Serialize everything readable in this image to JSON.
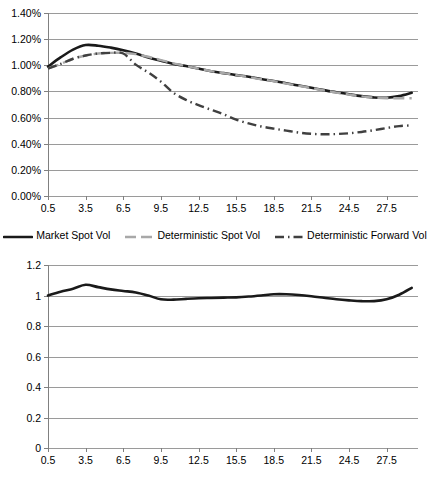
{
  "chart_data": [
    {
      "id": "volatility-term-structure",
      "type": "line",
      "title": "",
      "xlabel": "",
      "ylabel": "",
      "xlim": [
        0.5,
        30.0
      ],
      "ylim": [
        0.0,
        1.4
      ],
      "y_tick_labels": [
        "0.00%",
        "0.20%",
        "0.40%",
        "0.60%",
        "0.80%",
        "1.00%",
        "1.20%",
        "1.40%"
      ],
      "y_tick_values": [
        0.0,
        0.2,
        0.4,
        0.6,
        0.8,
        1.0,
        1.2,
        1.4
      ],
      "x_tick_labels": [
        "0.5",
        "3.5",
        "6.5",
        "9.5",
        "12.5",
        "15.5",
        "18.5",
        "21.5",
        "24.5",
        "27.5"
      ],
      "x_tick_values": [
        0.5,
        3.5,
        6.5,
        9.5,
        12.5,
        15.5,
        18.5,
        21.5,
        24.5,
        27.5
      ],
      "grid": "horizontal",
      "legend_position": "bottom",
      "x": [
        0.5,
        1.5,
        2.5,
        3.5,
        4.5,
        5.5,
        6.5,
        7.5,
        8.5,
        9.5,
        10.5,
        11.5,
        12.5,
        13.5,
        14.5,
        15.5,
        16.5,
        17.5,
        18.5,
        19.5,
        20.5,
        21.5,
        22.5,
        23.5,
        24.5,
        25.5,
        26.5,
        27.5,
        28.5,
        29.5
      ],
      "series": [
        {
          "name": "Market Spot Vol",
          "color": "#1a1a1a",
          "style": "solid",
          "values": [
            0.99,
            1.06,
            1.12,
            1.155,
            1.15,
            1.135,
            1.115,
            1.09,
            1.06,
            1.035,
            1.01,
            0.995,
            0.975,
            0.955,
            0.94,
            0.925,
            0.912,
            0.895,
            0.88,
            0.862,
            0.845,
            0.828,
            0.81,
            0.793,
            0.778,
            0.764,
            0.754,
            0.752,
            0.765,
            0.79
          ]
        },
        {
          "name": "Deterministic Spot Vol",
          "color": "#a8a8a8",
          "style": "dashed",
          "values": [
            0.975,
            1.01,
            1.05,
            1.075,
            1.09,
            1.095,
            1.095,
            1.085,
            1.065,
            1.04,
            1.015,
            0.995,
            0.975,
            0.955,
            0.94,
            0.925,
            0.91,
            0.893,
            0.878,
            0.86,
            0.843,
            0.826,
            0.808,
            0.791,
            0.776,
            0.762,
            0.752,
            0.748,
            0.748,
            0.748
          ]
        },
        {
          "name": "Deterministic Forward Vol",
          "color": "#404040",
          "style": "dash-dot",
          "values": [
            0.975,
            1.01,
            1.05,
            1.075,
            1.09,
            1.095,
            1.09,
            1.005,
            0.945,
            0.875,
            0.79,
            0.735,
            0.695,
            0.66,
            0.625,
            0.585,
            0.555,
            0.532,
            0.515,
            0.5,
            0.485,
            0.476,
            0.472,
            0.474,
            0.48,
            0.49,
            0.504,
            0.52,
            0.535,
            0.54
          ]
        }
      ]
    },
    {
      "id": "stochastic-multiplicative-correction",
      "type": "line",
      "title": "",
      "xlabel": "",
      "ylabel": "",
      "xlim": [
        0.5,
        30.0
      ],
      "ylim": [
        0.0,
        1.2
      ],
      "y_tick_labels": [
        "0",
        "0.2",
        "0.4",
        "0.6",
        "0.8",
        "1",
        "1.2"
      ],
      "y_tick_values": [
        0.0,
        0.2,
        0.4,
        0.6,
        0.8,
        1.0,
        1.2
      ],
      "x_tick_labels": [
        "0.5",
        "3.5",
        "6.5",
        "9.5",
        "12.5",
        "15.5",
        "18.5",
        "21.5",
        "24.5",
        "27.5"
      ],
      "x_tick_values": [
        0.5,
        3.5,
        6.5,
        9.5,
        12.5,
        15.5,
        18.5,
        21.5,
        24.5,
        27.5
      ],
      "grid": "horizontal",
      "legend_position": "bottom",
      "x": [
        0.5,
        1.5,
        2.5,
        3.5,
        4.5,
        5.5,
        6.5,
        7.5,
        8.5,
        9.5,
        10.5,
        11.5,
        12.5,
        13.5,
        14.5,
        15.5,
        16.5,
        17.5,
        18.5,
        19.5,
        20.5,
        21.5,
        22.5,
        23.5,
        24.5,
        25.5,
        26.5,
        27.5,
        28.5,
        29.5
      ],
      "series": [
        {
          "name": "Stochastic Multiplicative Correction",
          "color": "#1a1a1a",
          "style": "solid",
          "values": [
            1.0,
            1.025,
            1.045,
            1.07,
            1.055,
            1.04,
            1.03,
            1.02,
            1.0,
            0.975,
            0.973,
            0.978,
            0.982,
            0.984,
            0.986,
            0.988,
            0.993,
            1.0,
            1.008,
            1.008,
            1.003,
            0.995,
            0.985,
            0.975,
            0.968,
            0.963,
            0.963,
            0.975,
            1.005,
            1.05
          ]
        }
      ]
    }
  ]
}
